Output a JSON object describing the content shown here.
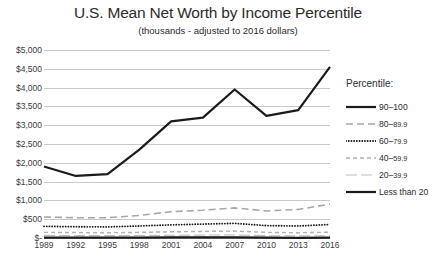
{
  "chart_data": {
    "type": "line",
    "title": "U.S. Mean Net Worth by Income Percentile",
    "subtitle": "(thousands - adjusted to 2016 dollars)",
    "xlabel": "",
    "ylabel": "",
    "categories": [
      "1989",
      "1992",
      "1995",
      "1998",
      "2001",
      "2004",
      "2007",
      "2010",
      "2013",
      "2016"
    ],
    "ylim": [
      0,
      5000
    ],
    "ytick_values": [
      5000,
      4500,
      4000,
      3500,
      3000,
      2500,
      2000,
      1500,
      1000,
      500,
      0
    ],
    "ytick_labels": [
      "$5,000",
      "$4,500",
      "$4,000",
      "$3,500",
      "$3,000",
      "$2,500",
      "$2,000",
      "$1,500",
      "$1,000",
      "$500",
      "$-"
    ],
    "grid": true,
    "legend_position": "right",
    "legend_title": "Percentile:",
    "series": [
      {
        "name": "90–100",
        "style": "solid-thick",
        "color": "#1a1a1a",
        "values": [
          1900,
          1650,
          1700,
          2350,
          3100,
          3200,
          3950,
          3250,
          3400,
          4550
        ]
      },
      {
        "name": "80–89.9",
        "style": "dashed",
        "color": "#a6a6a6",
        "values": [
          560,
          540,
          540,
          600,
          700,
          740,
          800,
          720,
          760,
          900
        ]
      },
      {
        "name": "60–79.9",
        "style": "dotted",
        "color": "#1a1a1a",
        "values": [
          310,
          300,
          295,
          320,
          350,
          370,
          390,
          330,
          320,
          360
        ]
      },
      {
        "name": "40–59.9",
        "style": "short-dash",
        "color": "#b0b0b0",
        "values": [
          150,
          145,
          140,
          150,
          165,
          175,
          185,
          150,
          140,
          155
        ]
      },
      {
        "name": "20–39.9",
        "style": "thin-long",
        "color": "#bdbdbd",
        "values": [
          70,
          65,
          62,
          65,
          72,
          78,
          80,
          62,
          55,
          62
        ]
      },
      {
        "name": "Less than 20",
        "style": "solid-thick",
        "color": "#1a1a1a",
        "values": [
          12,
          10,
          10,
          12,
          14,
          15,
          16,
          8,
          5,
          10
        ]
      }
    ]
  },
  "legend": {
    "title": "Percentile:",
    "items": [
      {
        "label_main": "90–100",
        "label_frac": ""
      },
      {
        "label_main": "80–",
        "label_frac": "89.9"
      },
      {
        "label_main": "60–",
        "label_frac": "79.9"
      },
      {
        "label_main": "40–",
        "label_frac": "59.9"
      },
      {
        "label_main": "20–",
        "label_frac": "39.9"
      },
      {
        "label_main": "Less than 20",
        "label_frac": ""
      }
    ]
  }
}
